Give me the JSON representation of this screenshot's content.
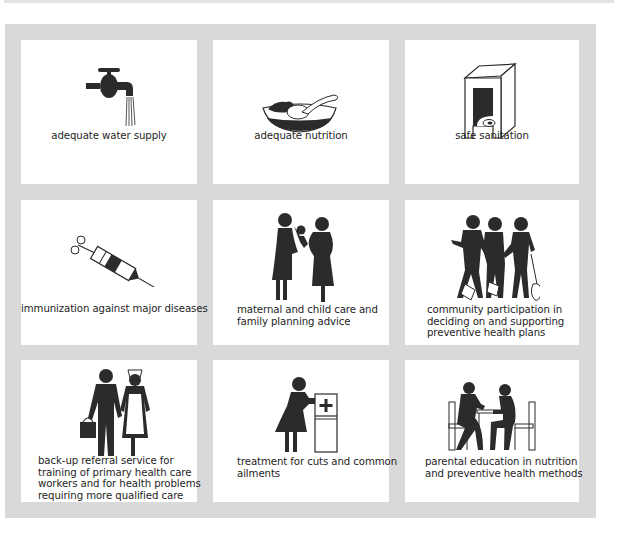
{
  "figure": {
    "layout": "3x3 grid of illustrated panels on gray frame",
    "colors": {
      "frame": "#d9d9d9",
      "panel": "#ffffff",
      "ink": "#2b2b2b"
    },
    "panels": [
      {
        "id": "water",
        "icon": "water-tap-icon",
        "caption_lines": [
          "adequate water supply"
        ]
      },
      {
        "id": "nutrition",
        "icon": "food-bowl-icon",
        "caption_lines": [
          "adequate nutrition"
        ]
      },
      {
        "id": "sanitation",
        "icon": "latrine-icon",
        "caption_lines": [
          "safe sanitation"
        ]
      },
      {
        "id": "immunization",
        "icon": "syringe-icon",
        "caption_lines": [
          "immunization against major diseases"
        ]
      },
      {
        "id": "maternal",
        "icon": "mother-child-icon",
        "caption_lines": [
          "maternal and child care and",
          "family planning advice"
        ]
      },
      {
        "id": "community",
        "icon": "workers-with-shovels-icon",
        "caption_lines": [
          "community participation in",
          "deciding on and supporting",
          "preventive health plans"
        ]
      },
      {
        "id": "referral",
        "icon": "doctor-nurse-icon",
        "caption_lines": [
          "back-up referral service for",
          "training of primary health care",
          "workers and for health problems",
          "requiring more qualified care"
        ]
      },
      {
        "id": "treatment",
        "icon": "first-aid-cabinet-icon",
        "caption_lines": [
          "treatment for cuts and common",
          "ailments"
        ]
      },
      {
        "id": "education",
        "icon": "two-people-at-table-icon",
        "caption_lines": [
          "parental education in nutrition",
          "and preventive health methods"
        ]
      }
    ]
  }
}
